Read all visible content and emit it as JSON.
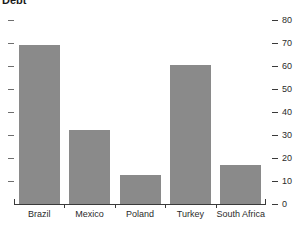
{
  "chart_data": {
    "type": "bar",
    "title": "Debt",
    "subtitle": "",
    "xlabel": "",
    "ylabel": "",
    "categories": [
      "Brazil",
      "Mexico",
      "Poland",
      "Turkey",
      "South Africa"
    ],
    "values": [
      69,
      32,
      12.5,
      60.5,
      17
    ],
    "ylim": [
      0,
      80
    ],
    "ytick_labels": [
      "0",
      "10",
      "20",
      "30",
      "40",
      "50",
      "60",
      "70",
      "80"
    ],
    "ytick_values": [
      0,
      10,
      20,
      30,
      40,
      50,
      60,
      70,
      80
    ],
    "grid": false,
    "legend": null,
    "axis_position": "right",
    "bar_color": "#8a8a8a",
    "axis_color": "#3a3a3a",
    "text_color": "#2b2b2b",
    "background": "#ffffff"
  }
}
